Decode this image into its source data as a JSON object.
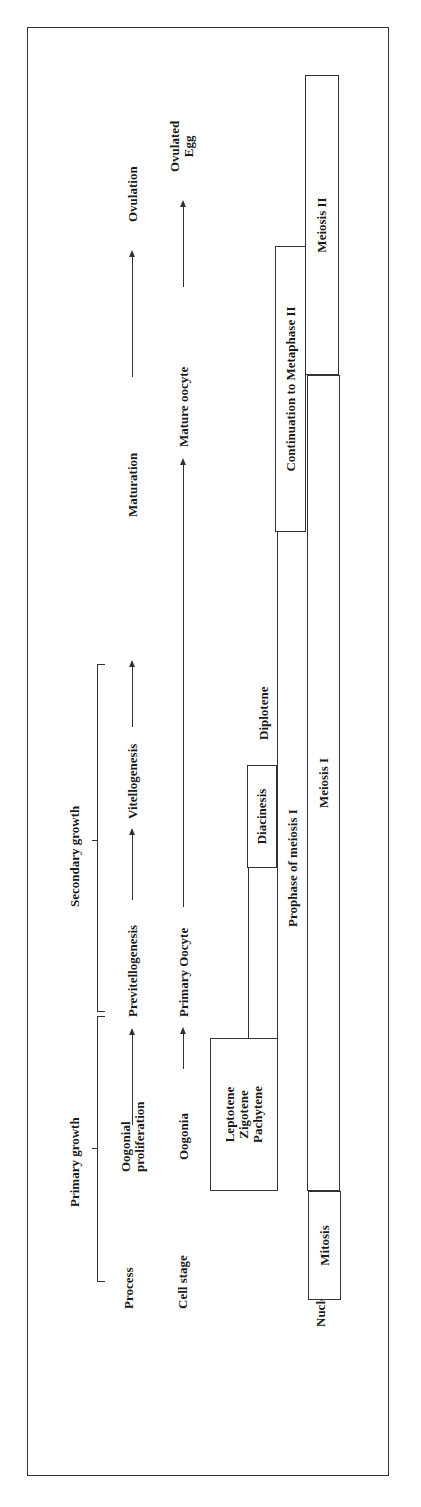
{
  "rows": {
    "process": "Process",
    "cell_stage": "Cell stage",
    "nucleus_phase": "Nucleus phase"
  },
  "growth": {
    "primary": "Primary growth",
    "secondary": "Secondary growth"
  },
  "process": {
    "oogonial_line1": "Oogonial",
    "oogonial_line2": "proliferation",
    "previtellogenesis": "Previtellogenesis",
    "vitellogenesis": "Vitellogenesis",
    "maturation": "Maturation",
    "ovulation": "Ovulation"
  },
  "cell_stage": {
    "oogonia": "Oogonia",
    "primary_oocyte": "Primary Oocyte",
    "mature_oocyte": "Mature oocyte",
    "ovulated_line1": "Ovulated",
    "ovulated_line2": "Egg"
  },
  "nucleus": {
    "mitosis": "Mitosis",
    "leptotene": "Leptotene",
    "zigotene": "Zigotene",
    "pachytene": "Pachytene",
    "diplotene": "Diplotene",
    "diacinesis": "Diacinesis",
    "prophase_meiosis_1": "Prophase of meiosis I",
    "continuation_metaphase_2": "Continuation to Metaphase II",
    "meiosis_1": "Meiosis I",
    "meiosis_2": "Meiosis II"
  }
}
